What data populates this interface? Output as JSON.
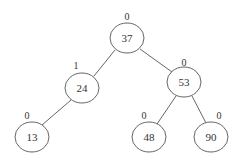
{
  "diagram": {
    "type": "binary-search-tree",
    "nodes": [
      {
        "id": "n37",
        "key": "37",
        "balance": "0",
        "cx": 127,
        "cy": 38,
        "bx": 127,
        "by": 16
      },
      {
        "id": "n24",
        "key": "24",
        "balance": "1",
        "cx": 82,
        "cy": 88,
        "bx": 76,
        "by": 65
      },
      {
        "id": "n53",
        "key": "53",
        "balance": "0",
        "cx": 184,
        "cy": 82,
        "bx": 184,
        "by": 62
      },
      {
        "id": "n13",
        "key": "13",
        "balance": "0",
        "cx": 32,
        "cy": 137,
        "bx": 27,
        "by": 115
      },
      {
        "id": "n48",
        "key": "48",
        "balance": "0",
        "cx": 149,
        "cy": 137,
        "bx": 144,
        "by": 115
      },
      {
        "id": "n90",
        "key": "90",
        "balance": "0",
        "cx": 211,
        "cy": 137,
        "bx": 219,
        "by": 115
      }
    ],
    "edges": [
      {
        "from": "37",
        "to": "24"
      },
      {
        "from": "37",
        "to": "53"
      },
      {
        "from": "24",
        "to": "13"
      },
      {
        "from": "53",
        "to": "48"
      },
      {
        "from": "53",
        "to": "90"
      }
    ]
  }
}
